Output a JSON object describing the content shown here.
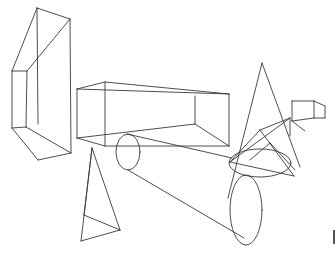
{
  "scene": {
    "background": "#ffffff",
    "stroke_color": "#3a3a3a",
    "description": "Wireframe line drawing of 3D geometric primitives",
    "shapes": [
      {
        "name": "tall-prism",
        "lines": [
          [
            37,
            8,
            70,
            19
          ],
          [
            37,
            8,
            12,
            71
          ],
          [
            37,
            8,
            38,
            124
          ],
          [
            70,
            19,
            71,
            153
          ],
          [
            70,
            19,
            27,
            71
          ],
          [
            12,
            71,
            27,
            71
          ],
          [
            12,
            71,
            12,
            128
          ],
          [
            27,
            71,
            26,
            127
          ],
          [
            12,
            128,
            26,
            127
          ],
          [
            12,
            128,
            38,
            160
          ],
          [
            38,
            160,
            71,
            153
          ],
          [
            26,
            127,
            71,
            153
          ]
        ]
      },
      {
        "name": "long-box",
        "lines": [
          [
            77,
            89,
            105,
            82
          ],
          [
            105,
            82,
            229,
            94
          ],
          [
            77,
            89,
            229,
            94
          ],
          [
            77,
            89,
            77,
            138
          ],
          [
            105,
            82,
            105,
            146
          ],
          [
            229,
            94,
            229,
            146
          ],
          [
            77,
            138,
            105,
            146
          ],
          [
            105,
            146,
            229,
            146
          ],
          [
            77,
            138,
            195,
            124
          ],
          [
            195,
            124,
            229,
            146
          ],
          [
            195,
            96,
            195,
            124
          ]
        ]
      },
      {
        "name": "small-cylinder-link",
        "ellipses": [
          [
            128,
            152,
            12,
            18
          ]
        ],
        "lines": [
          [
            127,
            134,
            232,
            158
          ],
          [
            128,
            170,
            244,
            238
          ]
        ]
      },
      {
        "name": "big-ellipse",
        "ellipses": [
          [
            246,
            210,
            16,
            35
          ]
        ]
      },
      {
        "name": "tall-cone",
        "lines": [
          [
            262,
            63,
            228,
            198
          ],
          [
            262,
            63,
            300,
            167
          ]
        ],
        "ellipses": [
          [
            260,
            163,
            31,
            14
          ]
        ]
      },
      {
        "name": "small-cube",
        "lines": [
          [
            292,
            101,
            314,
            101
          ],
          [
            314,
            101,
            325,
            106
          ],
          [
            292,
            101,
            292,
            121
          ],
          [
            314,
            101,
            314,
            118
          ],
          [
            325,
            106,
            325,
            118
          ],
          [
            292,
            121,
            314,
            118
          ],
          [
            314,
            118,
            325,
            118
          ],
          [
            292,
            121,
            305,
            131
          ]
        ]
      },
      {
        "name": "open-fan",
        "lines": [
          [
            230,
            162,
            260,
            130
          ],
          [
            260,
            130,
            290,
            118
          ],
          [
            230,
            162,
            290,
            118
          ],
          [
            260,
            130,
            294,
            176
          ],
          [
            290,
            118,
            290,
            136
          ],
          [
            230,
            162,
            294,
            176
          ],
          [
            270,
            143,
            295,
            170
          ],
          [
            250,
            160,
            270,
            143
          ]
        ]
      },
      {
        "name": "thin-pyramid",
        "lines": [
          [
            92,
            148,
            81,
            241
          ],
          [
            92,
            148,
            120,
            230
          ],
          [
            81,
            241,
            120,
            230
          ],
          [
            84,
            215,
            120,
            230
          ],
          [
            92,
            148,
            84,
            215
          ]
        ]
      }
    ],
    "edge_marker": {
      "x": 333,
      "y": 230,
      "height": 14
    }
  }
}
